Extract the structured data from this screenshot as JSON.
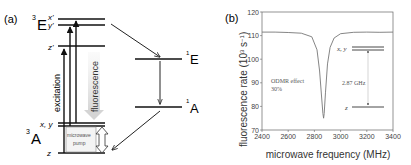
{
  "panel_a": {
    "label": "(a)",
    "states": {
      "triplet_excited": {
        "sup": "3",
        "name": "E",
        "sublevels": [
          "x'",
          "y'",
          "z'"
        ]
      },
      "triplet_ground": {
        "sup": "3",
        "name": "A",
        "sublevels": [
          "x, y",
          "z"
        ]
      },
      "singlet_upper": {
        "sup": "1",
        "name": "E"
      },
      "singlet_lower": {
        "sup": "1",
        "name": "A"
      }
    },
    "labels": {
      "excitation": "excitation",
      "fluorescence": "fluorescence",
      "microwave_line1": "microwave",
      "microwave_line2": "pump"
    }
  },
  "panel_b": {
    "label": "(b)",
    "annotation_odmr_line1": "ODMR effect",
    "annotation_odmr_line2": "30%",
    "inset": {
      "upper_level": "x, y",
      "lower_level": "z",
      "splitting": "2.87 GHz"
    }
  },
  "chart_data": {
    "type": "line",
    "title": "",
    "xlabel": "microwave frequency (MHz)",
    "ylabel": "fluorescence rate (10^3 s^-1)",
    "xlim": [
      2400,
      3400
    ],
    "ylim": [
      70,
      120
    ],
    "xticks": [
      2400,
      2600,
      2800,
      3000,
      3200,
      3400
    ],
    "yticks": [
      70,
      80,
      90,
      100,
      110,
      120
    ],
    "grid": false,
    "legend": null,
    "series": [
      {
        "name": "ODMR spectrum",
        "x": [
          2400,
          2500,
          2600,
          2700,
          2780,
          2820,
          2840,
          2855,
          2865,
          2870,
          2875,
          2885,
          2900,
          2920,
          2950,
          3000,
          3100,
          3200,
          3300,
          3400
        ],
        "y": [
          111.5,
          111.5,
          111.3,
          111.0,
          109.5,
          104,
          95,
          84,
          77,
          75,
          77,
          86,
          98,
          105,
          109,
          110.8,
          111.4,
          111.5,
          111.4,
          111.5
        ]
      }
    ],
    "annotations": [
      "ODMR effect 30%",
      "2.87 GHz",
      "x, y",
      "z"
    ]
  }
}
